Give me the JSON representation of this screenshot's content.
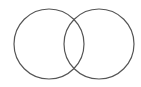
{
  "diagram": {
    "type": "venn",
    "background": "#ffffff",
    "stroke_color": "#555555",
    "circles": [
      {
        "id": "left",
        "cx": 49,
        "cy": 44,
        "r": 35
      },
      {
        "id": "right",
        "cx": 99,
        "cy": 44,
        "r": 35
      }
    ]
  }
}
